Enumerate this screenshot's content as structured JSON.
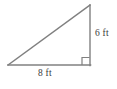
{
  "figure": {
    "kind": "right-triangle-diagram",
    "background_color": "#ffffff",
    "stroke_color": "#808080",
    "label_color": "#3a3a3a",
    "labels": {
      "vertical_leg": "6 ft",
      "horizontal_leg": "8 ft"
    },
    "geometry": {
      "vertex_bottom_left": [
        8,
        65
      ],
      "vertex_bottom_right": [
        90,
        65
      ],
      "vertex_top_right": [
        90,
        5
      ],
      "right_angle_marker": {
        "corner": "bottom-right",
        "size": 8
      }
    },
    "icons": {
      "right_angle": "right-angle-marker-icon"
    }
  }
}
